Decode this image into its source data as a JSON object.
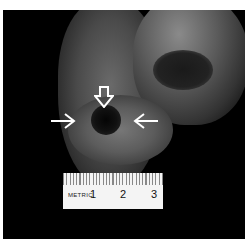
{
  "image": {
    "description": "Grayscale photograph of a tissue specimen on black background with three white arrows pointing to a dark central opening, and a metric ruler below",
    "arrows": [
      {
        "direction": "down",
        "style": "hollow",
        "position": "top of opening"
      },
      {
        "direction": "right",
        "style": "line",
        "position": "left of opening"
      },
      {
        "direction": "left",
        "style": "line",
        "position": "right of opening"
      }
    ]
  },
  "ruler": {
    "label": "METRIC",
    "numbers": [
      "1",
      "2",
      "3"
    ]
  },
  "colors": {
    "background": "#000000",
    "frame": "#ffffff",
    "ruler": "#f4f4f4"
  }
}
